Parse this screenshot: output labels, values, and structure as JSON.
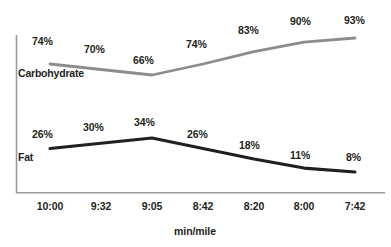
{
  "chart_data": {
    "type": "line",
    "title": "",
    "subtitle": "",
    "xlabel": "min/mile",
    "ylabel": "",
    "grid": false,
    "legend_position": "inline-left",
    "categories": [
      "10:00",
      "9:32",
      "9:05",
      "8:42",
      "8:20",
      "8:00",
      "7:42"
    ],
    "series": [
      {
        "name": "Carbohydrate",
        "color": "#8c8c8c",
        "values": [
          74,
          70,
          66,
          74,
          83,
          90,
          93
        ],
        "value_labels": [
          "74%",
          "70%",
          "66%",
          "74%",
          "83%",
          "90%",
          "93%"
        ]
      },
      {
        "name": "Fat",
        "color": "#231f20",
        "values": [
          26,
          30,
          34,
          26,
          18,
          11,
          8
        ],
        "value_labels": [
          "26%",
          "30%",
          "34%",
          "26%",
          "18%",
          "11%",
          "8%"
        ]
      }
    ],
    "ylim": [
      0,
      100
    ],
    "yunit": "%"
  },
  "axis": {
    "x_title": "min/mile",
    "ticks": [
      "10:00",
      "9:32",
      "9:05",
      "8:42",
      "8:20",
      "8:00",
      "7:42"
    ]
  },
  "series_labels": {
    "carbohydrate": "Carbohydrate",
    "fat": "Fat"
  },
  "carb_values": {
    "v0": "74%",
    "v1": "70%",
    "v2": "66%",
    "v3": "74%",
    "v4": "83%",
    "v5": "90%",
    "v6": "93%"
  },
  "fat_values": {
    "v0": "26%",
    "v1": "30%",
    "v2": "34%",
    "v3": "26%",
    "v4": "18%",
    "v5": "11%",
    "v6": "8%"
  },
  "ticks": {
    "t0": "10:00",
    "t1": "9:32",
    "t2": "9:05",
    "t3": "8:42",
    "t4": "8:20",
    "t5": "8:00",
    "t6": "7:42"
  },
  "colors": {
    "carbohydrate_line": "#8c8c8c",
    "fat_line": "#231f20",
    "axis": "#9a9a9a",
    "text": "#231f20",
    "background": "#ffffff"
  }
}
